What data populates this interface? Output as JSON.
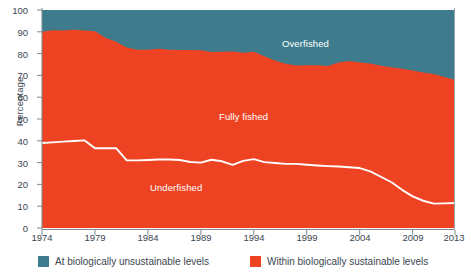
{
  "chart_data": {
    "type": "area",
    "title": "",
    "subtitle": "",
    "xlabel": "",
    "ylabel": "Percentage",
    "xlim": [
      1974,
      2013
    ],
    "ylim": [
      0,
      100
    ],
    "grid": false,
    "stacked": true,
    "legend_position": "bottom",
    "x": [
      1974,
      1975,
      1976,
      1977,
      1978,
      1979,
      1980,
      1981,
      1982,
      1983,
      1984,
      1985,
      1986,
      1987,
      1988,
      1989,
      1990,
      1991,
      1992,
      1993,
      1994,
      1995,
      1996,
      1997,
      1998,
      1999,
      2000,
      2001,
      2002,
      2003,
      2004,
      2005,
      2006,
      2007,
      2008,
      2009,
      2010,
      2011,
      2012,
      2013
    ],
    "x_ticks": [
      1974,
      1979,
      1984,
      1989,
      1994,
      1999,
      2004,
      2009,
      2013
    ],
    "y_ticks": [
      0,
      10,
      20,
      30,
      40,
      50,
      60,
      70,
      80,
      90,
      100
    ],
    "series": [
      {
        "name": "Underfished",
        "color": "#EE4323",
        "label_in_chart": "Underfished",
        "values": [
          39.0,
          39.3,
          39.6,
          39.9,
          40.2,
          36.6,
          36.6,
          36.6,
          31.0,
          31.0,
          31.2,
          31.4,
          31.4,
          31.2,
          30.3,
          30.0,
          31.3,
          30.6,
          29.0,
          30.8,
          31.6,
          30.2,
          29.8,
          29.4,
          29.4,
          29.0,
          28.7,
          28.4,
          28.2,
          27.9,
          27.5,
          26.0,
          23.5,
          21.0,
          17.5,
          14.5,
          12.5,
          11.2,
          11.3,
          11.5
        ]
      },
      {
        "name": "Fully fished",
        "color": "#EE4323",
        "label_in_chart": "Fully fished",
        "values": [
          51.0,
          51.4,
          51.0,
          51.0,
          50.4,
          53.6,
          50.7,
          48.8,
          51.8,
          50.8,
          50.6,
          50.8,
          50.4,
          50.4,
          51.3,
          51.5,
          49.4,
          50.3,
          52.0,
          49.6,
          49.2,
          48.6,
          47.0,
          45.9,
          45.1,
          45.6,
          45.9,
          45.9,
          47.7,
          48.7,
          48.4,
          49.5,
          50.9,
          52.7,
          55.6,
          57.8,
          58.8,
          59.4,
          58.0,
          56.5
        ]
      },
      {
        "name": "Overfished",
        "color": "#3E7B8C",
        "label_in_chart": "Overfished",
        "values": [
          10.0,
          9.3,
          9.4,
          9.1,
          9.4,
          9.8,
          12.7,
          14.6,
          17.2,
          18.2,
          18.2,
          17.8,
          18.2,
          18.4,
          18.4,
          18.5,
          19.3,
          19.1,
          19.0,
          19.6,
          19.2,
          21.2,
          23.2,
          24.7,
          25.5,
          25.4,
          25.4,
          25.7,
          24.1,
          23.4,
          24.1,
          24.5,
          25.6,
          26.3,
          26.9,
          27.7,
          28.7,
          29.4,
          30.7,
          32.0
        ]
      }
    ],
    "boundaries": {
      "note": "cumulative upper edge of red (sustainable) band, i.e. 100 - overfished",
      "sustainable_total": [
        90.0,
        90.7,
        90.6,
        90.9,
        90.6,
        90.2,
        87.3,
        85.4,
        82.8,
        81.8,
        81.8,
        82.2,
        81.8,
        81.6,
        81.6,
        81.5,
        80.7,
        80.9,
        81.0,
        80.4,
        80.8,
        78.8,
        76.8,
        75.3,
        74.5,
        74.6,
        74.6,
        74.3,
        75.9,
        76.6,
        75.9,
        75.5,
        74.4,
        73.7,
        73.1,
        72.3,
        71.3,
        70.6,
        69.3,
        68.0
      ]
    },
    "legend": [
      {
        "label": "At biologically unsustainable levels",
        "color": "#3E7B8C",
        "key": "unsustainable"
      },
      {
        "label": "Within biologically sustainable levels",
        "color": "#EE4323",
        "key": "sustainable"
      }
    ],
    "colors": {
      "overfished": "#3E7B8C",
      "sustainable": "#EE4323",
      "underfished_line": "#FFFFFF",
      "axis": "#7B8994",
      "text": "#3B4650",
      "background": "#FFFFFF"
    }
  }
}
